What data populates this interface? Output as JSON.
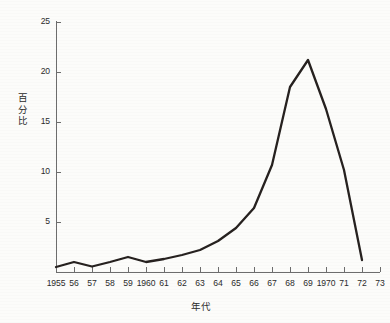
{
  "chart_data": {
    "type": "line",
    "title": "",
    "xlabel": "年代",
    "ylabel": "百分比",
    "x": [
      1955,
      1956,
      1957,
      1958,
      1959,
      1960,
      1961,
      1962,
      1963,
      1964,
      1965,
      1966,
      1967,
      1968,
      1969,
      1970,
      1971,
      1972
    ],
    "values": [
      0.5,
      1.0,
      0.55,
      1.0,
      1.5,
      1.0,
      1.3,
      1.7,
      2.2,
      3.1,
      4.4,
      6.4,
      10.7,
      18.5,
      21.2,
      16.3,
      10.2,
      1.2
    ],
    "xtick_labels": [
      "1955",
      "56",
      "57",
      "58",
      "59",
      "1960",
      "61",
      "62",
      "63",
      "64",
      "65",
      "66",
      "67",
      "68",
      "69",
      "1970",
      "71",
      "72",
      "73"
    ],
    "xtick_values": [
      1955,
      1956,
      1957,
      1958,
      1959,
      1960,
      1961,
      1962,
      1963,
      1964,
      1965,
      1966,
      1967,
      1968,
      1969,
      1970,
      1971,
      1972,
      1973
    ],
    "ytick_labels": [
      "5",
      "10",
      "15",
      "20",
      "25"
    ],
    "ytick_values": [
      5,
      10,
      15,
      20,
      25
    ],
    "xlim": [
      1955,
      1973
    ],
    "ylim": [
      0,
      25
    ],
    "grid": false,
    "legend": false,
    "series_color": "#26211f",
    "axis_color": "#6d6d6d",
    "background_color": "#fcfcfa"
  },
  "axis_titles": {
    "y": "百分比",
    "x": "年代"
  }
}
